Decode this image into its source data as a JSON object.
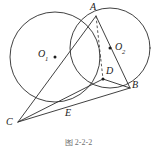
{
  "figure": {
    "caption": "图 2-2-2",
    "stroke_color": "#2b2b2b",
    "background_color": "#ffffff"
  },
  "labels": {
    "A": "A",
    "B": "B",
    "C": "C",
    "D": "D",
    "E": "E",
    "O1_base": "O",
    "O1_sub": "1",
    "O2_base": "O",
    "O2_sub": "2"
  },
  "geometry": {
    "circles": [
      {
        "name": "circle-O1",
        "cx": 55,
        "cy": 57,
        "r": 45
      },
      {
        "name": "circle-O2",
        "cx": 110,
        "cy": 48,
        "r": 40
      }
    ],
    "points": [
      {
        "name": "A",
        "x": 96,
        "y": 16
      },
      {
        "name": "B",
        "x": 130,
        "y": 88
      },
      {
        "name": "C",
        "x": 18,
        "y": 122
      },
      {
        "name": "D",
        "x": 103,
        "y": 79
      },
      {
        "name": "E",
        "x": 71,
        "y": 105
      },
      {
        "name": "O1",
        "x": 55,
        "y": 57
      },
      {
        "name": "O2",
        "x": 110,
        "y": 48
      }
    ],
    "segments": [
      {
        "name": "segment-CA",
        "from": "C",
        "to": "A"
      },
      {
        "name": "segment-CD",
        "from": "C",
        "to": "D"
      },
      {
        "name": "segment-CB",
        "from": "C",
        "to": "B"
      },
      {
        "name": "segment-AB",
        "from": "A",
        "to": "B"
      },
      {
        "name": "segment-DB",
        "from": "D",
        "to": "B"
      }
    ],
    "dashed_segments": [
      {
        "name": "segment-AD-dashed",
        "from": "A",
        "to": "D"
      }
    ]
  }
}
